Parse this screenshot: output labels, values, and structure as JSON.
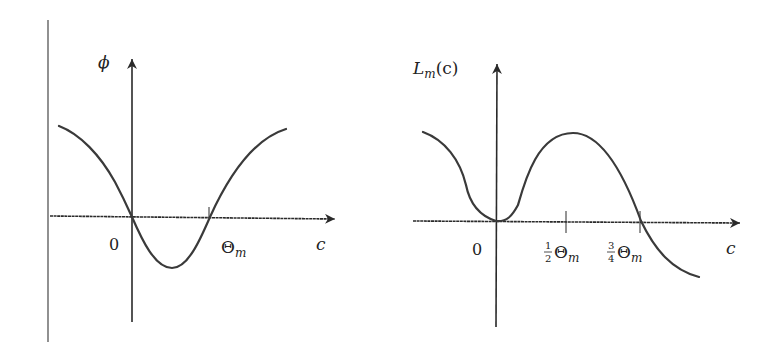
{
  "figures": [
    {
      "id": "phi",
      "y_label": "ϕ",
      "x_label": "c",
      "origin_label": "0",
      "tick_labels": [
        {
          "main": "Θ",
          "sub": "m"
        }
      ],
      "curve_description": "cosine-like curve: decreasing through origin, minimum between 0 and Θm, crossing zero at Θm, rising"
    },
    {
      "id": "Lm",
      "y_label": {
        "main": "L",
        "sub": "m",
        "arg": "(c)"
      },
      "x_label": "c",
      "origin_label": "0",
      "tick_labels": [
        {
          "frac_num": "1",
          "frac_den": "2",
          "main": "Θ",
          "sub": "m"
        },
        {
          "frac_num": "3",
          "frac_den": "4",
          "main": "Θ",
          "sub": "m"
        }
      ],
      "curve_description": "touches zero at origin (minimum), peaks near ½Θm, crosses zero at ¾Θm, continues negative"
    }
  ],
  "colors": {
    "axis": "#2a2a2a",
    "curve": "#3a3a3a",
    "divider": "#555555"
  }
}
